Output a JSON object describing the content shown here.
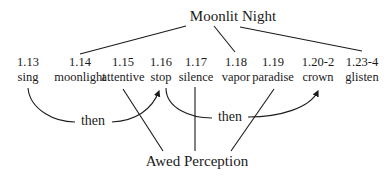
{
  "diagram": {
    "top_node": "Moonlit Night",
    "bottom_node": "Awed Perception",
    "items": [
      {
        "num": "1.13",
        "word": "sing",
        "x": 28
      },
      {
        "num": "1.14",
        "word": "moonlight",
        "x": 80
      },
      {
        "num": "1.15",
        "word": "attentive",
        "x": 123
      },
      {
        "num": "1.16",
        "word": "stop",
        "x": 161
      },
      {
        "num": "1.17",
        "word": "silence",
        "x": 196
      },
      {
        "num": "1.18",
        "word": "vapor",
        "x": 236
      },
      {
        "num": "1.19",
        "word": "paradise",
        "x": 273
      },
      {
        "num": "1.20-2",
        "word": "crown",
        "x": 318
      },
      {
        "num": "1.23-4",
        "word": "glisten",
        "x": 362
      }
    ],
    "connectors": [
      {
        "label": "then",
        "from": "sing",
        "to": "stop"
      },
      {
        "label": "then",
        "from": "stop",
        "to": "crown"
      }
    ],
    "top_links": [
      "moonlight",
      "vapor",
      "glisten"
    ],
    "bottom_links": [
      "attentive",
      "silence",
      "paradise"
    ]
  }
}
